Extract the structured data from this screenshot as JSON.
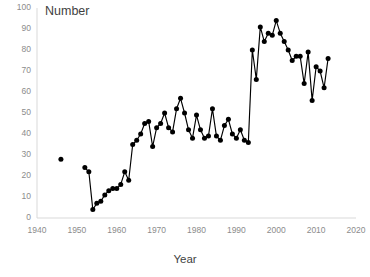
{
  "chart_data": {
    "type": "line",
    "title": "Number",
    "xlabel": "Year",
    "ylabel": "",
    "xlim": [
      1940,
      2020
    ],
    "ylim": [
      0,
      100
    ],
    "xticks": [
      1940,
      1950,
      1960,
      1970,
      1980,
      1990,
      2000,
      2010,
      2020
    ],
    "yticks": [
      0,
      10,
      20,
      30,
      40,
      50,
      60,
      70,
      80,
      90,
      100
    ],
    "grid": false,
    "legend": "none",
    "marker": "circle",
    "line_color": "#000000",
    "marker_color": "#000000",
    "axis_color": "#d9d9d9",
    "tick_label_color": "#8c8c8c",
    "background": "#ffffff",
    "series": [
      {
        "name": "Number",
        "points": [
          [
            1946,
            28
          ],
          [
            1952,
            24
          ],
          [
            1953,
            22
          ],
          [
            1954,
            4
          ],
          [
            1955,
            7
          ],
          [
            1956,
            8
          ],
          [
            1957,
            11
          ],
          [
            1958,
            13
          ],
          [
            1959,
            14
          ],
          [
            1960,
            14
          ],
          [
            1961,
            16
          ],
          [
            1962,
            22
          ],
          [
            1963,
            18
          ],
          [
            1964,
            35
          ],
          [
            1965,
            37
          ],
          [
            1966,
            40
          ],
          [
            1967,
            45
          ],
          [
            1968,
            46
          ],
          [
            1969,
            34
          ],
          [
            1970,
            43
          ],
          [
            1971,
            45
          ],
          [
            1972,
            50
          ],
          [
            1973,
            43
          ],
          [
            1974,
            41
          ],
          [
            1975,
            52
          ],
          [
            1976,
            57
          ],
          [
            1977,
            50
          ],
          [
            1978,
            42
          ],
          [
            1979,
            38
          ],
          [
            1980,
            49
          ],
          [
            1981,
            42
          ],
          [
            1982,
            38
          ],
          [
            1983,
            39
          ],
          [
            1984,
            52
          ],
          [
            1985,
            39
          ],
          [
            1986,
            37
          ],
          [
            1987,
            44
          ],
          [
            1988,
            47
          ],
          [
            1989,
            40
          ],
          [
            1990,
            38
          ],
          [
            1991,
            42
          ],
          [
            1992,
            37
          ],
          [
            1993,
            36
          ],
          [
            1994,
            80
          ],
          [
            1995,
            66
          ],
          [
            1996,
            91
          ],
          [
            1997,
            84
          ],
          [
            1998,
            88
          ],
          [
            1999,
            87
          ],
          [
            2000,
            94
          ],
          [
            2001,
            88
          ],
          [
            2002,
            84
          ],
          [
            2003,
            80
          ],
          [
            2004,
            75
          ],
          [
            2005,
            77
          ],
          [
            2006,
            77
          ],
          [
            2007,
            64
          ],
          [
            2008,
            79
          ],
          [
            2009,
            56
          ],
          [
            2010,
            72
          ],
          [
            2011,
            70
          ],
          [
            2012,
            62
          ],
          [
            2013,
            76
          ]
        ]
      }
    ]
  }
}
